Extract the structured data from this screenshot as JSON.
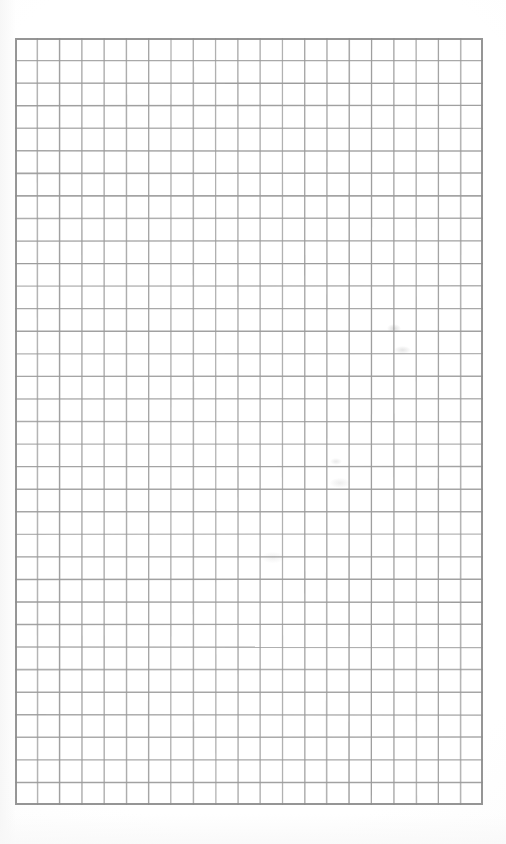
{
  "document": {
    "type": "scanned-grid-paper",
    "title": "Blank Grid Paper Sheet",
    "description": "Scanned sheet of blank square grid (graph) paper with no written content",
    "orientation": "portrait",
    "page_width_px": 506,
    "page_height_px": 844,
    "background_color": "#ffffff",
    "has_text_content": "false"
  },
  "grid": {
    "columns": 21,
    "rows": 34,
    "origin_x_px": 15,
    "origin_y_px": 38,
    "width_px": 468,
    "height_px": 767,
    "cell_width_px": 22.29,
    "cell_height_px": 22.56,
    "line_color": "#9a9a9a",
    "outer_border_color": "#8c8c8c",
    "inner_line_width_px": 1.4,
    "outer_line_width_px": 2,
    "cell_fill_color": "#ffffff",
    "label": "21 by 34 square grid"
  },
  "artifacts": {
    "label": "Faint scan smudges",
    "items": [
      {
        "name": "smudge-upper-right",
        "x_px": 394,
        "y_px": 329,
        "intensity": "very-faint"
      },
      {
        "name": "smudge-upper-right-lower",
        "x_px": 402,
        "y_px": 350,
        "intensity": "very-faint"
      },
      {
        "name": "smudge-mid-right",
        "x_px": 340,
        "y_px": 483,
        "intensity": "extremely-faint"
      },
      {
        "name": "smudge-mid-center",
        "x_px": 273,
        "y_px": 558,
        "intensity": "extremely-faint"
      }
    ]
  },
  "margins": {
    "top_px": 38,
    "left_px": 15,
    "right_px": 23,
    "bottom_px": 39
  }
}
